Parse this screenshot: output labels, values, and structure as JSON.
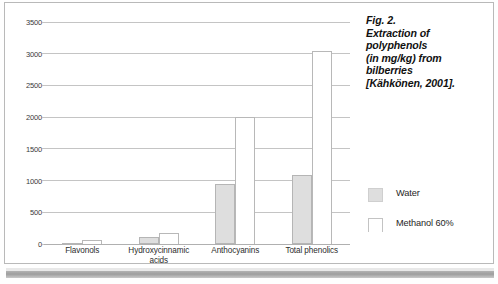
{
  "caption": {
    "lines": [
      "Fig. 2.",
      "Extraction of",
      "polyphenols",
      "(in mg/kg) from",
      "bilberries",
      "[Kähkönen, 2001]."
    ]
  },
  "legend": {
    "items": [
      {
        "label": "Water",
        "swatch": "water",
        "color": "#dedede"
      },
      {
        "label": "Methanol 60%",
        "swatch": "methanol",
        "color": "#ffffff"
      }
    ]
  },
  "chart_data": {
    "type": "bar",
    "xlabel": "",
    "ylabel": "",
    "ylim": [
      0,
      3500
    ],
    "yticks": [
      0,
      500,
      1000,
      1500,
      2000,
      2500,
      3000,
      3500
    ],
    "ytick_labels": [
      "0",
      "500",
      "1000",
      "1500",
      "2000",
      "2500",
      "3000",
      "3500"
    ],
    "grid": true,
    "legend_position": "right",
    "categories": [
      "Flavonols",
      "Hydroxycinnamic acids",
      "Anthocyanins",
      "Total phenolics"
    ],
    "category_label_lines": [
      [
        "Flavonols"
      ],
      [
        "Hydroxycinnamic",
        "acids"
      ],
      [
        "Anthocyanins"
      ],
      [
        "Total phenolics"
      ]
    ],
    "series": [
      {
        "name": "Water",
        "color": "#dedede",
        "values": [
          20,
          110,
          940,
          1080
        ]
      },
      {
        "name": "Methanol 60%",
        "color": "#ffffff",
        "values": [
          60,
          180,
          2010,
          3050
        ]
      }
    ]
  }
}
